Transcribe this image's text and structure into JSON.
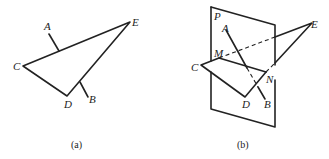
{
  "figure_a": {
    "caption": "(a)",
    "labels": {
      "A": "A",
      "B": "B",
      "C": "C",
      "D": "D",
      "E": "E"
    }
  },
  "figure_b": {
    "caption": "(b)",
    "labels": {
      "P": "P",
      "A": "A",
      "B": "B",
      "C": "C",
      "D": "D",
      "E": "E",
      "M": "M",
      "N": "N"
    }
  }
}
